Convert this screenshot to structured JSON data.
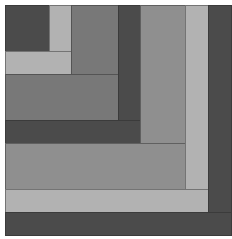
{
  "figure": {
    "colors": {
      "dark": "#4b4b4b",
      "medium": "#787878",
      "medium_light": "#8f8f8f",
      "light": "#b2b2b2",
      "background": "#ffffff"
    },
    "blocks": [
      {
        "name": "center-dark-square",
        "x": 5,
        "y": 5,
        "w": 45,
        "h": 47,
        "tone": "dark"
      },
      {
        "name": "light-vertical-strip-1",
        "x": 49,
        "y": 5,
        "w": 23,
        "h": 47,
        "tone": "light"
      },
      {
        "name": "light-horizontal-strip-1",
        "x": 5,
        "y": 51,
        "w": 67,
        "h": 24,
        "tone": "light"
      },
      {
        "name": "medium-vertical-block-2",
        "x": 71,
        "y": 5,
        "w": 48,
        "h": 70,
        "tone": "medium"
      },
      {
        "name": "medium-horizontal-block-2",
        "x": 5,
        "y": 74,
        "w": 114,
        "h": 47,
        "tone": "medium"
      },
      {
        "name": "dark-vertical-strip-3",
        "x": 118,
        "y": 5,
        "w": 23,
        "h": 139,
        "tone": "dark"
      },
      {
        "name": "dark-horizontal-strip-3",
        "x": 5,
        "y": 120,
        "w": 136,
        "h": 24,
        "tone": "dark"
      },
      {
        "name": "medium-light-vertical-block-4",
        "x": 140,
        "y": 5,
        "w": 46,
        "h": 185,
        "tone": "medium_light"
      },
      {
        "name": "medium-light-horizontal-block-4",
        "x": 5,
        "y": 143,
        "w": 181,
        "h": 47,
        "tone": "medium_light"
      },
      {
        "name": "light-vertical-strip-5",
        "x": 185,
        "y": 5,
        "w": 24,
        "h": 208,
        "tone": "light"
      },
      {
        "name": "light-horizontal-strip-5",
        "x": 5,
        "y": 189,
        "w": 204,
        "h": 24,
        "tone": "light"
      },
      {
        "name": "dark-vertical-strip-6",
        "x": 208,
        "y": 5,
        "w": 24,
        "h": 231,
        "tone": "dark"
      },
      {
        "name": "dark-horizontal-strip-6",
        "x": 5,
        "y": 212,
        "w": 227,
        "h": 24,
        "tone": "dark"
      }
    ]
  }
}
